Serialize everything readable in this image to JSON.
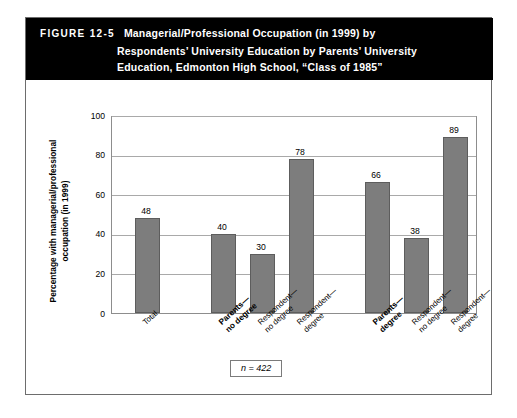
{
  "figure": {
    "number_label": "FIGURE 12-5",
    "title_lines": [
      "Managerial/Professional Occupation (in 1999) by",
      "Respondents’ University Education by Parents’ University",
      "Education, Edmonton High School, “Class of 1985”"
    ],
    "note": "n = 422",
    "colors": {
      "header_background": "#000000",
      "header_text": "#ffffff",
      "bar_fill": "#7d7d7d",
      "bar_outline": "#5d5d5d",
      "gridline": "#a9a9a9",
      "frame": "#6d6d6d"
    }
  },
  "chart_data": {
    "type": "bar",
    "title": "Managerial/Professional Occupation (in 1999) by Respondents’ University Education by Parents’ University Education, Edmonton High School, “Class of 1985”",
    "xlabel": "",
    "ylabel": "Percentage with managerial/professional occupation (in 1999)",
    "ylabel_lines": [
      "Percentage with managerial/professional",
      "occupation (in 1999)"
    ],
    "ylim": [
      0,
      100
    ],
    "yticks": [
      0,
      20,
      40,
      60,
      80,
      100
    ],
    "ytick_labels": [
      "0",
      "20",
      "40",
      "60",
      "80",
      "100"
    ],
    "grid": true,
    "legend": "none",
    "annotations": [
      "n = 422"
    ],
    "categories": [
      "Total",
      "Parents—no degree",
      "Respondent—no degree",
      "Respondent—degree",
      "Parents—degree",
      "Respondent—no degree",
      "Respondent—degree"
    ],
    "category_label_lines": [
      [
        "Total"
      ],
      [
        "Parents—",
        "no degree"
      ],
      [
        "Respondent—",
        "no degree"
      ],
      [
        "Respondent—",
        "degree"
      ],
      [
        "Parents—",
        "degree"
      ],
      [
        "Respondent—",
        "no degree"
      ],
      [
        "Respondent—",
        "degree"
      ]
    ],
    "category_emphasis": [
      false,
      true,
      false,
      false,
      true,
      false,
      false
    ],
    "values": [
      48,
      40,
      30,
      78,
      66,
      38,
      89
    ],
    "value_labels": [
      "48",
      "40",
      "30",
      "78",
      "66",
      "38",
      "89"
    ]
  }
}
